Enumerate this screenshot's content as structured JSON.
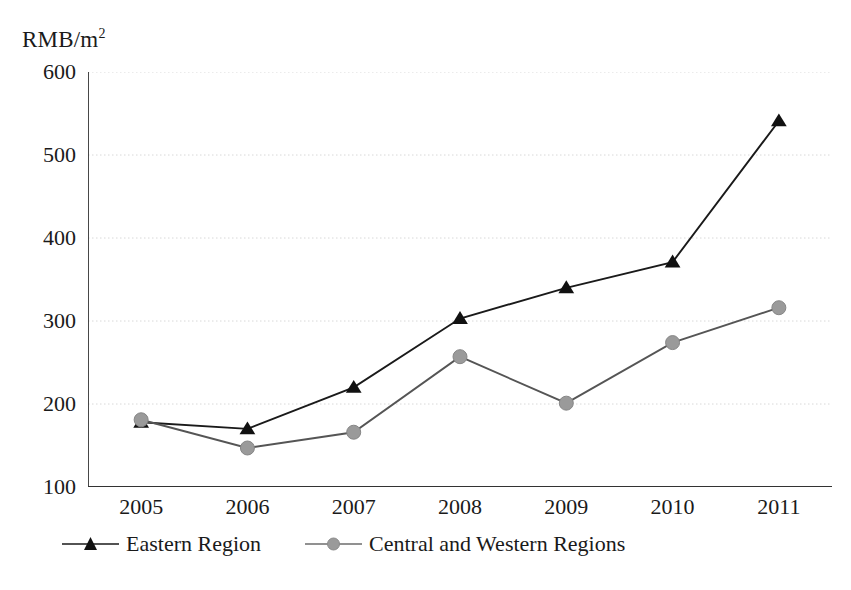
{
  "chart_data": {
    "type": "line",
    "title": "",
    "xlabel": "",
    "ylabel": "RMB/m2",
    "ylabel_display": "RMB/m",
    "ylabel_exponent": "2",
    "categories": [
      "2005",
      "2006",
      "2007",
      "2008",
      "2009",
      "2010",
      "2011"
    ],
    "series": [
      {
        "name": "Eastern Region",
        "marker": "triangle",
        "color": "#1a1a1a",
        "values": [
          178,
          170,
          220,
          303,
          340,
          371,
          541
        ]
      },
      {
        "name": "Central and Western Regions",
        "marker": "circle",
        "color": "#9a9a9a",
        "values": [
          181,
          147,
          166,
          257,
          201,
          274,
          316
        ]
      }
    ],
    "ylim": [
      100,
      600
    ],
    "yticks": [
      100,
      200,
      300,
      400,
      500,
      600
    ],
    "ytick_labels": [
      "100",
      "200",
      "300",
      "400",
      "500",
      "600"
    ],
    "yminor_step": 50,
    "grid": true,
    "grid_color": "#d8d8d8",
    "legend_position": "bottom",
    "axis_color": "#333333",
    "background": "#ffffff"
  },
  "legend": {
    "entries": [
      {
        "label": "Eastern Region"
      },
      {
        "label": "Central and Western Regions"
      }
    ]
  }
}
